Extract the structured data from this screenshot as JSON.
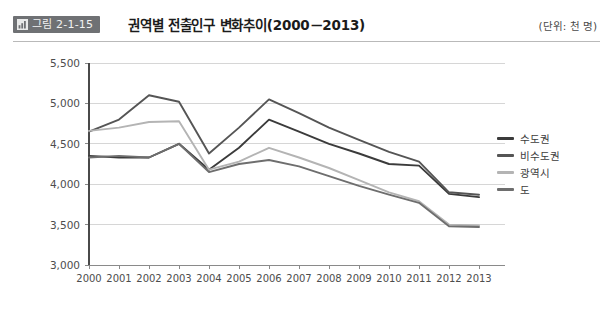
{
  "header": {
    "badge_label": "그림 2-1-15",
    "badge_icon": "bar-chart-icon",
    "title": "권역별 전출인구 변화추이(2000－2013)",
    "unit_note": "(단위: 천 명)"
  },
  "chart_data": {
    "type": "line",
    "title": "권역별 전출인구 변화추이(2000－2013)",
    "xlabel": "",
    "ylabel": "",
    "unit": "천 명",
    "grid": true,
    "legend_position": "right",
    "ylim": [
      3000,
      5500
    ],
    "ytick_step": 500,
    "yticks": [
      "3,000",
      "3,500",
      "4,000",
      "4,500",
      "5,000",
      "5,500"
    ],
    "categories": [
      "2000",
      "2001",
      "2002",
      "2003",
      "2004",
      "2005",
      "2006",
      "2007",
      "2008",
      "2009",
      "2010",
      "2011",
      "2012",
      "2013"
    ],
    "series": [
      {
        "name": "수도권",
        "color": "#3b3b3b",
        "values": [
          4350,
          4330,
          4330,
          4500,
          4180,
          4450,
          4800,
          4650,
          4500,
          4380,
          4250,
          4230,
          3880,
          3840
        ]
      },
      {
        "name": "비수도권",
        "color": "#555555",
        "values": [
          4650,
          4800,
          5100,
          5020,
          4380,
          4700,
          5050,
          4880,
          4700,
          4550,
          4400,
          4280,
          3900,
          3870
        ]
      },
      {
        "name": "광역시",
        "color": "#b4b4b4",
        "values": [
          4660,
          4700,
          4770,
          4780,
          4180,
          4280,
          4450,
          4330,
          4200,
          4050,
          3900,
          3790,
          3500,
          3490
        ]
      },
      {
        "name": "도",
        "color": "#6e6e6e",
        "values": [
          4330,
          4350,
          4330,
          4500,
          4150,
          4250,
          4300,
          4220,
          4100,
          3980,
          3870,
          3770,
          3480,
          3470
        ]
      }
    ]
  }
}
